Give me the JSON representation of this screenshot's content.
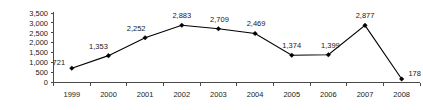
{
  "chart_data": {
    "type": "line",
    "title": "",
    "subtitle": "",
    "xlabel": "",
    "ylabel": "",
    "categories": [
      "1999",
      "2000",
      "2001",
      "2002",
      "2003",
      "2004",
      "2005",
      "2006",
      "2007",
      "2008"
    ],
    "values": [
      721,
      1353,
      2252,
      2883,
      2709,
      2469,
      1374,
      1399,
      2877,
      178
    ],
    "data_labels": [
      "721",
      "1,353",
      "2,252",
      "2,883",
      "2,709",
      "2,469",
      "1,374",
      "1,399",
      "2,877",
      "178"
    ],
    "series": [
      {
        "name": "",
        "values": [
          721,
          1353,
          2252,
          2883,
          2709,
          2469,
          1374,
          1399,
          2877,
          178
        ],
        "color": "#000000",
        "marker": "diamond"
      }
    ],
    "ylim": [
      0,
      3500
    ],
    "ytick_values": [
      0,
      500,
      1000,
      1500,
      2000,
      2500,
      3000,
      3500
    ],
    "ytick_labels": [
      "0",
      "500",
      "1,000",
      "1,500",
      "2,000",
      "2,500",
      "3,000",
      "3,500"
    ],
    "grid": false,
    "legend": false,
    "legend_position": "none",
    "axis_color": "#4a4a4a",
    "text_color": "#1a1a1a",
    "background_color": "#ffffff"
  },
  "label_offsets": [
    {
      "dx": -13,
      "dy": -3
    },
    {
      "dx": -10,
      "dy": -7
    },
    {
      "dx": -9,
      "dy": -7
    },
    {
      "dx": 0,
      "dy": -7
    },
    {
      "dx": 1,
      "dy": -7
    },
    {
      "dx": 1,
      "dy": -7
    },
    {
      "dx": 0,
      "dy": -7
    },
    {
      "dx": 2,
      "dy": -7
    },
    {
      "dx": 0,
      "dy": -7
    },
    {
      "dx": 13,
      "dy": -3
    }
  ]
}
